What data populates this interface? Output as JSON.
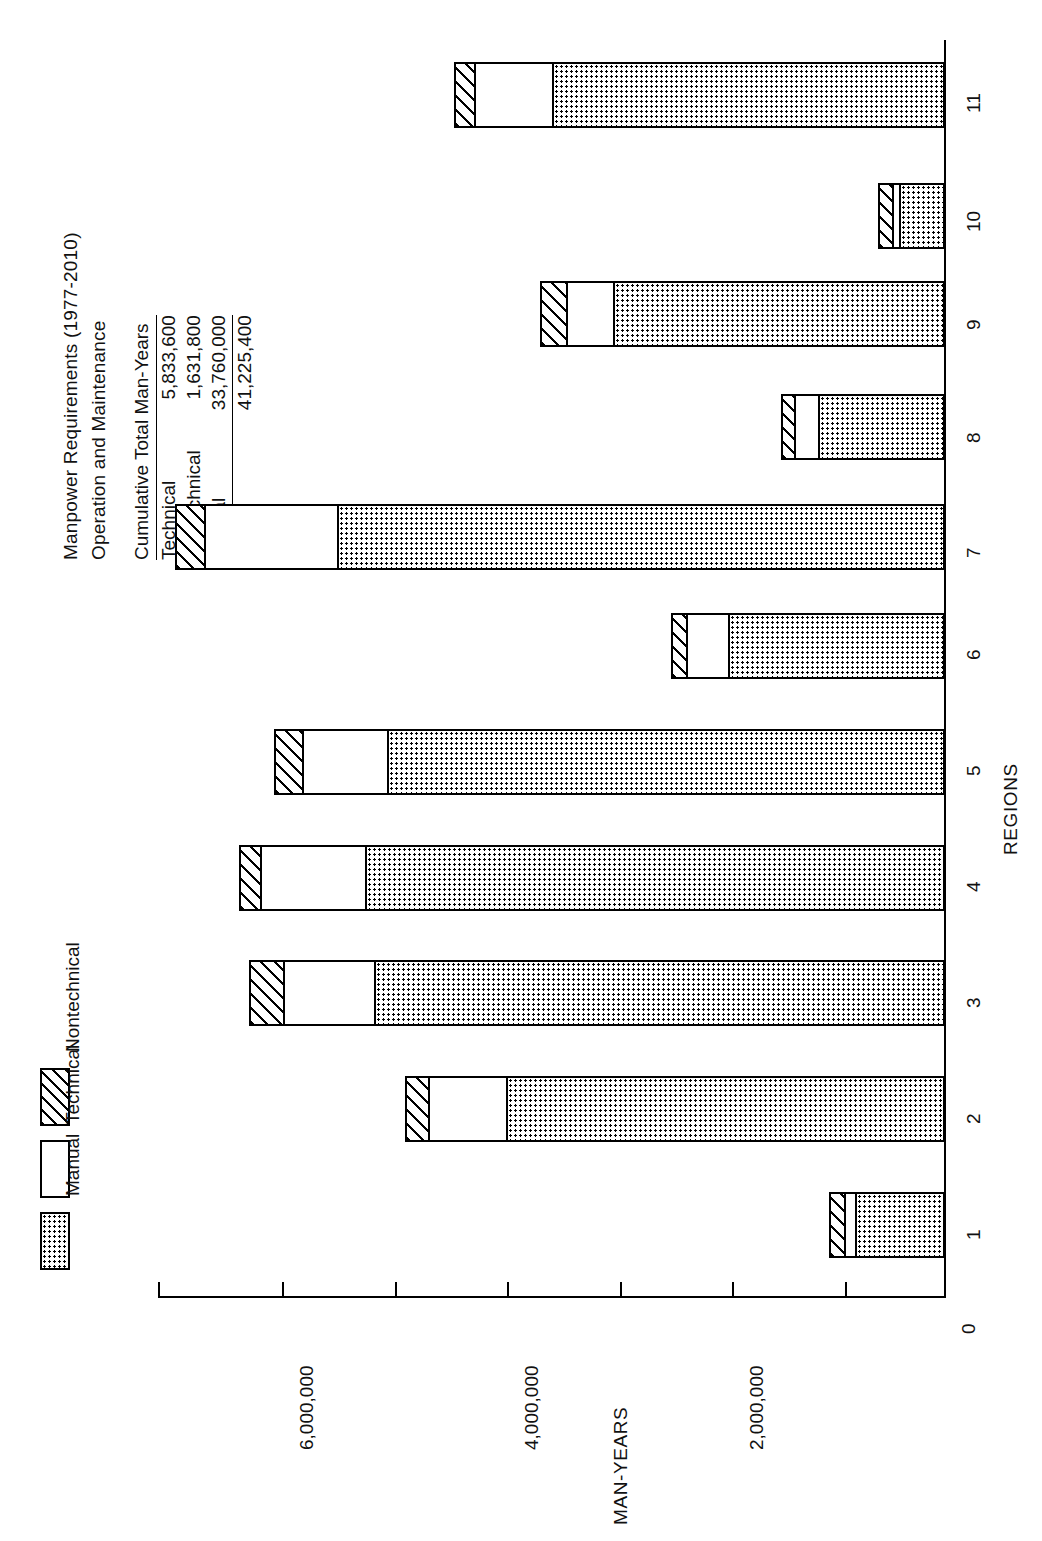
{
  "header": {
    "title_line1": "Manpower Requirements (1977-2010)",
    "title_line2": "Operation and Maintenance"
  },
  "summary_table": {
    "header": "Cumulative Total Man-Years",
    "rows": [
      {
        "label": "Technical",
        "value": "5,833,600"
      },
      {
        "label": "Nontechnical",
        "value": "1,631,800"
      },
      {
        "label": "Manual",
        "value": "33,760,000"
      }
    ],
    "total": {
      "label": "Total",
      "value": "41,225,400"
    }
  },
  "legend": {
    "items": [
      {
        "label": "Nontechnical",
        "pattern": "diagonal-hatch"
      },
      {
        "label": "Technical",
        "pattern": "open-white"
      },
      {
        "label": "Manual",
        "pattern": "dotted-stipple"
      }
    ]
  },
  "axes": {
    "value_axis_title": "MAN-YEARS",
    "category_axis_title": "REGIONS",
    "value_ticks": [
      "0",
      "2,000,000",
      "4,000,000",
      "6,000,000"
    ],
    "value_tick_values": [
      0,
      2000000,
      4000000,
      6000000
    ],
    "minor_tick_values": [
      1000000,
      3000000,
      5000000,
      7000000
    ]
  },
  "chart_data": {
    "type": "bar",
    "orientation": "horizontal-rotated",
    "stacked": true,
    "title": "Manpower Requirements (1977-2010) Operation and Maintenance",
    "xlabel": "REGIONS",
    "ylabel": "MAN-YEARS",
    "ylim": [
      0,
      7100000
    ],
    "grid": false,
    "legend_position": "top-left",
    "categories": [
      "1",
      "2",
      "3",
      "4",
      "5",
      "6",
      "7",
      "8",
      "9",
      "10",
      "11"
    ],
    "series": [
      {
        "name": "Manual",
        "values": [
          790000,
          3900000,
          5070000,
          5150000,
          4960000,
          1920000,
          5400000,
          1120000,
          2950000,
          400000,
          3490000
        ]
      },
      {
        "name": "Technical",
        "values": [
          120000,
          720000,
          840000,
          960000,
          780000,
          400000,
          1210000,
          240000,
          440000,
          80000,
          720000
        ]
      },
      {
        "name": "Nontechnical",
        "values": [
          120000,
          180000,
          280000,
          170000,
          230000,
          120000,
          240000,
          100000,
          210000,
          120000,
          160000
        ]
      }
    ],
    "totals": [
      1030000,
      4800000,
      6190000,
      6280000,
      5970000,
      2440000,
      6850000,
      1460000,
      3600000,
      600000,
      4370000
    ]
  }
}
